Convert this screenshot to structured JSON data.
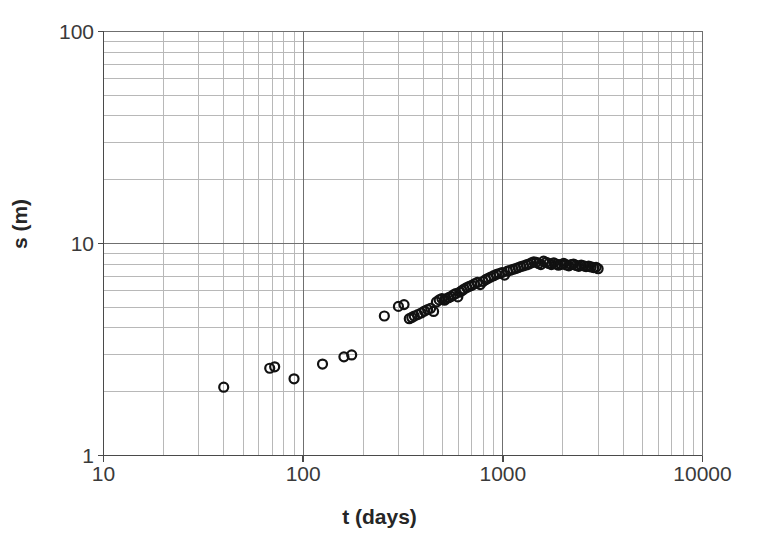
{
  "chart_data": {
    "type": "scatter",
    "title": "",
    "xlabel": "t (days)",
    "ylabel": "s (m)",
    "xscale": "log",
    "yscale": "log",
    "xlim": [
      10,
      10000
    ],
    "ylim": [
      1,
      100
    ],
    "grid": true,
    "grid_minor": true,
    "legend": null,
    "marker": "open-circle",
    "marker_color": "#000000",
    "marker_size_px": 9,
    "xticks": [
      10,
      100,
      1000,
      10000
    ],
    "xticklabels": [
      "10",
      "100",
      "1000",
      "10000"
    ],
    "yticks": [
      1,
      10,
      100
    ],
    "yticklabels": [
      "1",
      "10",
      "100"
    ],
    "series": [
      {
        "name": "settlement",
        "x": [
          40,
          68,
          72,
          90,
          125,
          160,
          175,
          255,
          300,
          320,
          340,
          350,
          360,
          375,
          390,
          405,
          420,
          435,
          450,
          465,
          480,
          495,
          510,
          520,
          535,
          550,
          565,
          580,
          595,
          610,
          625,
          640,
          660,
          680,
          700,
          720,
          745,
          770,
          795,
          820,
          845,
          870,
          900,
          930,
          960,
          990,
          1020,
          1055,
          1090,
          1125,
          1160,
          1195,
          1230,
          1270,
          1310,
          1350,
          1390,
          1430,
          1470,
          1510,
          1550,
          1600,
          1650,
          1700,
          1750,
          1800,
          1850,
          1900,
          1960,
          2020,
          2080,
          2140,
          2200,
          2260,
          2330,
          2400,
          2470,
          2540,
          2610,
          2690,
          2770,
          2850,
          2930,
          3000
        ],
        "y": [
          2.1,
          2.58,
          2.62,
          2.3,
          2.7,
          2.92,
          2.98,
          4.55,
          5.05,
          5.15,
          4.42,
          4.48,
          4.55,
          4.62,
          4.7,
          4.8,
          4.88,
          4.95,
          4.78,
          5.3,
          5.42,
          5.5,
          5.4,
          5.48,
          5.55,
          5.62,
          5.72,
          5.8,
          5.6,
          5.9,
          6.0,
          6.1,
          6.2,
          6.28,
          6.35,
          6.45,
          6.55,
          6.4,
          6.62,
          6.75,
          6.85,
          6.95,
          7.05,
          7.15,
          7.22,
          7.3,
          7.1,
          7.4,
          7.48,
          7.55,
          7.62,
          7.7,
          7.78,
          7.85,
          7.92,
          8.0,
          8.1,
          8.2,
          8.15,
          8.05,
          7.95,
          8.25,
          8.15,
          8.05,
          7.95,
          8.1,
          8.0,
          7.9,
          7.98,
          8.05,
          7.92,
          7.85,
          7.95,
          8.0,
          7.88,
          7.8,
          7.9,
          7.85,
          7.78,
          7.82,
          7.75,
          7.7,
          7.72,
          7.6
        ]
      }
    ]
  },
  "axes": {
    "x_title": "t (days)",
    "y_title": "s (m)",
    "x_tick_labels": [
      "10",
      "100",
      "1000",
      "10000"
    ],
    "y_tick_labels": [
      "100",
      "10",
      "1"
    ]
  },
  "style": {
    "grid_color": "#6f6f6f",
    "minor_grid_color": "#b8b8b8",
    "axis_color": "#555555",
    "marker_edge_color": "#111111",
    "background": "#ffffff"
  }
}
